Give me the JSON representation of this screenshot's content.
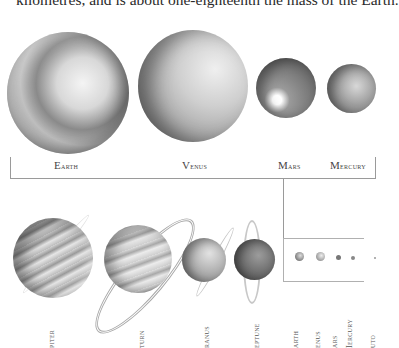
{
  "caption": "kilometres, and is about one-eighteenth the mass of the Earth.",
  "inner_planets": [
    {
      "name": "Earth",
      "label": "Earth"
    },
    {
      "name": "Venus",
      "label": "Venus"
    },
    {
      "name": "Mars",
      "label": "Mars"
    },
    {
      "name": "Mercury",
      "label": "Mercury"
    }
  ],
  "outer_planets": [
    {
      "name": "Jupiter",
      "label": "piter"
    },
    {
      "name": "Saturn",
      "label": "turn"
    },
    {
      "name": "Uranus",
      "label": "ranus"
    },
    {
      "name": "Neptune",
      "label": "eptune"
    }
  ],
  "scale_box_labels": [
    {
      "name": "Earth",
      "label": "arth"
    },
    {
      "name": "Venus",
      "label": "enus"
    },
    {
      "name": "Mars",
      "label": "ars"
    },
    {
      "name": "Mercury",
      "label": "Iercury"
    },
    {
      "name": "Pluto",
      "label": "uto"
    }
  ],
  "colors": {
    "line": "#9a9a9a",
    "text": "#2a2a2a"
  }
}
